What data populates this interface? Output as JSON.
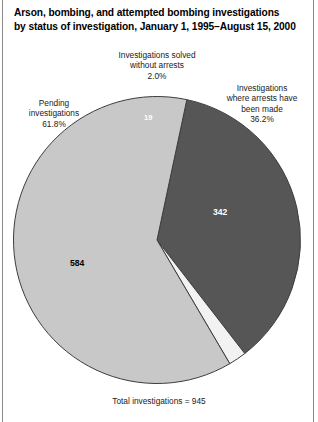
{
  "title": {
    "line1": "Arson, bombing, and attempted bombing investigations",
    "line2": "by status of investigation, January 1, 1995–August 15, 2000"
  },
  "callouts": {
    "solved": {
      "line1": "Investigations solved",
      "line2": "without arrests",
      "percent": "2.0%"
    },
    "arrests": {
      "line1": "Investigations",
      "line2": "where arrests have",
      "line3": "been made",
      "percent": "36.2%"
    },
    "pending": {
      "line1": "Pending",
      "line2": "investigations",
      "percent": "61.8%"
    }
  },
  "slice_values": {
    "solved": "19",
    "arrests": "342",
    "pending": "584"
  },
  "footnote": "Total investigations = 945",
  "colors": {
    "arrests": "#565656",
    "pending": "#c8c8c8",
    "solved": "#f2f2f2",
    "outline": "#3d3d3d",
    "text": "#1a1a1a",
    "background": "#ffffff"
  },
  "chart_data": {
    "type": "pie",
    "title": "Arson, bombing, and attempted bombing investigations by status of investigation, January 1, 1995–August 15, 2000",
    "xlabel": "",
    "ylabel": "",
    "total": 945,
    "total_label": "Total investigations = 945",
    "legend": "callout-labels",
    "grid": false,
    "start_angle_deg": 12,
    "direction": "clockwise",
    "categories": [
      "Investigations where arrests have been made",
      "Investigations solved without arrests",
      "Pending investigations"
    ],
    "values": [
      342,
      19,
      584
    ],
    "percents": [
      36.2,
      2.0,
      61.8
    ],
    "slice_colors": [
      "#565656",
      "#f2f2f2",
      "#c8c8c8"
    ],
    "slices": [
      {
        "label": "Investigations where arrests have been made",
        "value": 342,
        "percent": 36.2,
        "color": "#565656",
        "data_label": "342"
      },
      {
        "label": "Investigations solved without arrests",
        "value": 19,
        "percent": 2.0,
        "color": "#f2f2f2",
        "data_label": "19"
      },
      {
        "label": "Pending investigations",
        "value": 584,
        "percent": 61.8,
        "color": "#c8c8c8",
        "data_label": "584"
      }
    ]
  }
}
